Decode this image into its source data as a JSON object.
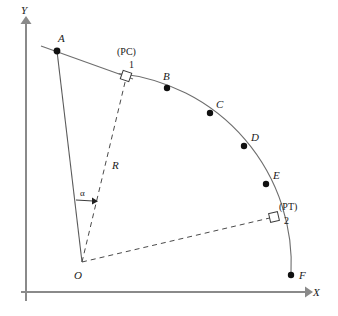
{
  "figure": {
    "background_color": "#ffffff",
    "axes": {
      "x_label": "X",
      "y_label": "Y",
      "axis_color": "#8a8a8a",
      "origin_px": [
        26,
        292
      ]
    },
    "geometry": {
      "arc_center_label": "O",
      "arc_center_px": [
        82,
        262
      ],
      "arc_radius_px": 192,
      "curve_color": "#6e6e6e",
      "radius_color": "#4a4a4a",
      "dot_color": "#101010"
    },
    "labels": {
      "point_a": "A",
      "point_b": "B",
      "point_c": "C",
      "point_d": "D",
      "point_e": "E",
      "point_f": "F",
      "point_o": "O",
      "radius": "R",
      "angle_alpha": "α",
      "pc_tag": "(PC)",
      "pc_number": "1",
      "pt_tag": "(PT)",
      "pt_number": "2"
    },
    "points": [
      {
        "name": "A",
        "label": "A",
        "x": 57,
        "y": 51,
        "label_x": 58,
        "label_y": 42,
        "dot": true
      },
      {
        "name": "B",
        "label": "B",
        "x": 167,
        "y": 88,
        "label_x": 164,
        "label_y": 79,
        "dot": true
      },
      {
        "name": "C",
        "label": "C",
        "x": 210,
        "y": 113,
        "label_x": 217,
        "label_y": 107,
        "dot": true
      },
      {
        "name": "D",
        "label": "D",
        "x": 244,
        "y": 146,
        "label_x": 252,
        "label_y": 140,
        "dot": true
      },
      {
        "name": "E",
        "label": "E",
        "x": 266,
        "y": 184,
        "label_x": 274,
        "label_y": 178,
        "dot": true
      },
      {
        "name": "F",
        "label": "F",
        "x": 291,
        "y": 275,
        "label_x": 299,
        "label_y": 278,
        "dot": true
      }
    ],
    "markers": {
      "pc": {
        "tag": "(PC)",
        "number": "1",
        "square_x": 126,
        "square_y": 76,
        "tag_x": 118,
        "tag_y": 54,
        "num_x": 130,
        "num_y": 68
      },
      "pt": {
        "tag": "(PT)",
        "number": "2",
        "square_x": 274,
        "square_y": 217,
        "tag_x": 281,
        "tag_y": 209,
        "num_x": 286,
        "num_y": 223
      }
    },
    "annotations": {
      "radius_label": {
        "text": "R",
        "x": 113,
        "y": 168
      },
      "alpha_label": {
        "text": "α",
        "x": 82,
        "y": 196
      },
      "origin_label": {
        "text": "O",
        "x": 77,
        "y": 276
      }
    }
  }
}
